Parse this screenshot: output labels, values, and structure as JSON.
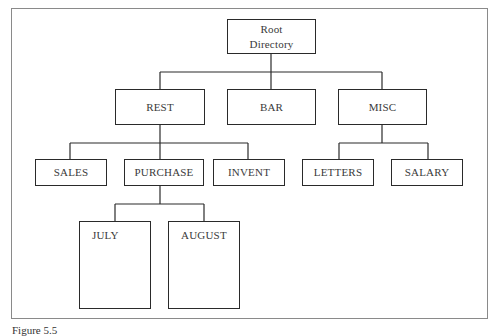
{
  "diagram": {
    "type": "directory-tree",
    "nodes": {
      "root": {
        "label_line1": "Root",
        "label_line2": "Directory"
      },
      "rest": {
        "label": "REST"
      },
      "bar": {
        "label": "BAR"
      },
      "misc": {
        "label": "MISC"
      },
      "sales": {
        "label": "SALES"
      },
      "purchase": {
        "label": "PURCHASE"
      },
      "invent": {
        "label": "INVENT"
      },
      "letters": {
        "label": "LETTERS"
      },
      "salary": {
        "label": "SALARY"
      },
      "july": {
        "label": "JULY"
      },
      "august": {
        "label": "AUGUST"
      }
    },
    "edges": [
      [
        "root",
        "rest"
      ],
      [
        "root",
        "bar"
      ],
      [
        "root",
        "misc"
      ],
      [
        "rest",
        "sales"
      ],
      [
        "rest",
        "purchase"
      ],
      [
        "rest",
        "invent"
      ],
      [
        "misc",
        "letters"
      ],
      [
        "misc",
        "salary"
      ],
      [
        "purchase",
        "july"
      ],
      [
        "purchase",
        "august"
      ]
    ]
  },
  "caption": "Figure 5.5"
}
